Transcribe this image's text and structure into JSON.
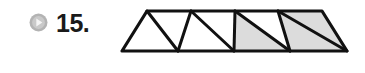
{
  "problem": {
    "number_label": "15.",
    "bullet_icon": "play-circle-icon",
    "bullet_circle_color": "#b3b3b3",
    "bullet_triangle_color": "#f2f2f2"
  },
  "figure": {
    "name": "trapezoid-divided-into-triangles",
    "outline_color": "#111111",
    "shaded_fill": "#dcdcdc",
    "unshaded_fill": "#ffffff",
    "total_parts": 9,
    "shaded_parts": 5,
    "unshaded_parts": 4,
    "geometry": {
      "top_left": [
        35,
        8
      ],
      "top_right": [
        210,
        8
      ],
      "bottom_left": [
        10,
        48
      ],
      "bottom_right": [
        235,
        48
      ],
      "top_vertices_x": [
        35,
        79,
        123,
        166,
        210
      ],
      "bottom_vertices_x": [
        10,
        66,
        122,
        178,
        235
      ],
      "baseline_y": 48,
      "topline_y": 8
    },
    "parts": [
      {
        "id": 1,
        "orientation": "right-half",
        "shaded": false,
        "points": "10,48 35,8 66,48"
      },
      {
        "id": 2,
        "orientation": "down",
        "shaded": false,
        "points": "35,8 79,8 66,48"
      },
      {
        "id": 3,
        "orientation": "up",
        "shaded": false,
        "points": "66,48 79,8 122,48"
      },
      {
        "id": 4,
        "orientation": "down",
        "shaded": false,
        "points": "79,8 123,8 122,48"
      },
      {
        "id": 5,
        "orientation": "up",
        "shaded": true,
        "points": "122,48 123,8 178,48"
      },
      {
        "id": 6,
        "orientation": "down",
        "shaded": false,
        "points": "123,8 166,8 178,48"
      },
      {
        "id": 7,
        "orientation": "up",
        "shaded": true,
        "points": "178,48 166,8 235,48"
      },
      {
        "id": 8,
        "orientation": "down",
        "shaded": true,
        "points": "166,8 210,8 235,48"
      },
      {
        "id": 9,
        "orientation": "left-half",
        "shaded": true,
        "points": "210,8 235,48 235,48"
      }
    ],
    "segments": [
      "35,8 66,48",
      "79,8 66,48",
      "79,8 122,48",
      "123,8 122,48",
      "123,8 178,48",
      "166,8 178,48",
      "166,8 235,48"
    ]
  }
}
